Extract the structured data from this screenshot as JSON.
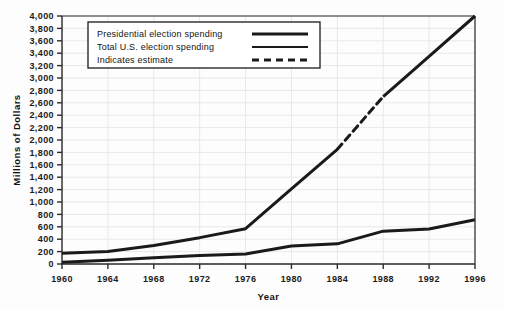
{
  "chart_data": {
    "type": "line",
    "title": "",
    "xlabel": "Year",
    "ylabel": "Millions of Dollars",
    "x": [
      1960,
      1964,
      1968,
      1972,
      1976,
      1980,
      1984,
      1988,
      1992,
      1996
    ],
    "xlim": [
      1960,
      1996
    ],
    "ylim": [
      0,
      4000
    ],
    "ytick_step": 200,
    "grid": true,
    "legend_position": "top-left-inside",
    "xtick_labels": [
      "1960",
      "1964",
      "1968",
      "1972",
      "1976",
      "1980",
      "1984",
      "1988",
      "1992",
      "1996"
    ],
    "ytick_labels": [
      "0",
      "200",
      "400",
      "600",
      "800",
      "1,000",
      "1,200",
      "1,400",
      "1,600",
      "1,800",
      "2,000",
      "2,200",
      "2,400",
      "2,600",
      "2,800",
      "3,000",
      "3,200",
      "3,400",
      "3,600",
      "3,800",
      "4,000"
    ],
    "series": [
      {
        "name": "Total U.S. election spending",
        "style": "solid-with-dashed-estimate",
        "values": [
          175,
          200,
          300,
          425,
          570,
          1210,
          1850,
          2700,
          3350,
          4000
        ],
        "estimate_segment": {
          "from_year": 1984,
          "to_year": 1988,
          "from_value": 1850,
          "to_value": 2700
        }
      },
      {
        "name": "Presidential election spending",
        "style": "solid",
        "values": [
          30,
          60,
          100,
          138,
          160,
          290,
          325,
          530,
          565,
          715
        ]
      }
    ]
  },
  "legend": {
    "entries": [
      {
        "label": "Presidential election spending",
        "swatch": "thick-solid"
      },
      {
        "label": "Total U.S. election spending",
        "swatch": "thin-solid"
      },
      {
        "label": "Indicates estimate",
        "swatch": "dashed"
      }
    ]
  },
  "colors": {
    "line": "#1a1a1a",
    "axis": "#2b2b2b",
    "grid": "#e8e8ea",
    "background": "#fdfdfd",
    "text": "#141414"
  }
}
